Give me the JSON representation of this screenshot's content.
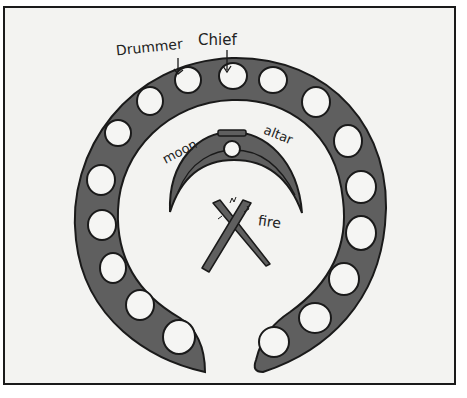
{
  "diagram": {
    "type": "ceremonial-ground-layout",
    "labels": {
      "drummer": "Drummer",
      "chief": "Chief",
      "moon": "moon",
      "altar": "altar",
      "fire": "fire"
    },
    "elements": {
      "ring": "horseshoe-shaped seating ring, open at the bottom",
      "seat_count": 17,
      "moon": "crescent-shaped mound",
      "altar": "small circle at top of crescent",
      "fire": "two crossed logs"
    },
    "colors": {
      "ring_fill": "#5f5f5f",
      "outline": "#1a1a1a",
      "background": "#f3f3f1",
      "seat_fill": "#f5f5f3"
    }
  }
}
